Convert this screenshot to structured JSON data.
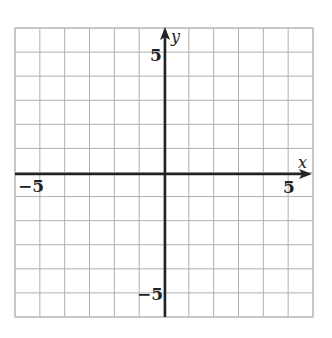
{
  "chart_data": {
    "type": "coordinate-grid",
    "x_range": [
      -6,
      6
    ],
    "y_range": [
      -6,
      6
    ],
    "grid_step": 1,
    "grid": true,
    "axes": {
      "x_label": "x",
      "y_label": "y"
    },
    "tick_labels": {
      "x_neg": "−5",
      "x_pos": "5",
      "y_pos": "5",
      "y_neg": "−5"
    },
    "colors": {
      "grid": "#b0b0b0",
      "axis": "#222222"
    }
  }
}
